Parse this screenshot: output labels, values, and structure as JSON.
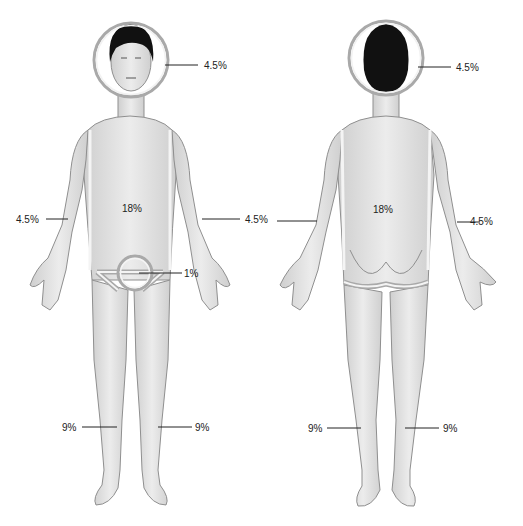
{
  "diagram": {
    "colors": {
      "skin": "#e4e4e4",
      "skin_shade": "#c9c9c9",
      "outline": "#8f8f8f",
      "hair": "#111111",
      "ring": "#a9a9a9",
      "ring_inner": "#f2f2f2",
      "leader": "#222222"
    },
    "front": {
      "head": "4.5%",
      "torso": "18%",
      "left_arm": "4.5%",
      "right_arm": "4.5%",
      "genitals": "1%",
      "left_leg": "9%",
      "right_leg": "9%"
    },
    "back": {
      "head": "4.5%",
      "torso": "18%",
      "left_arm": "4.5%",
      "right_arm": "4.5%",
      "left_leg": "9%",
      "right_leg": "9%"
    }
  }
}
